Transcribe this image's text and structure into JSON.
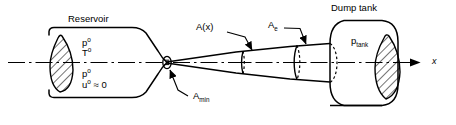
{
  "figure": {
    "kind": "converging-diverging-nozzle-schematic",
    "labels": {
      "reservoir": "Reservoir",
      "dump_tank": "Dump tank",
      "area_x": "A(x)",
      "area_exit_base": "A",
      "area_exit_sub": "e",
      "area_min_base": "A",
      "area_min_sub": "min",
      "p_tank_base": "p",
      "p_tank_sub": "tank",
      "axis_x": "x"
    },
    "reservoir_conditions": {
      "upper": [
        {
          "base": "p",
          "sup": "o"
        },
        {
          "base": "T",
          "sup": "o"
        }
      ],
      "lower": [
        {
          "base": "p",
          "sup": "o"
        },
        {
          "base": "u",
          "sup": "o",
          "tail": " ≈ 0"
        }
      ]
    },
    "colors": {
      "line": "#000000",
      "background": "#ffffff"
    }
  }
}
